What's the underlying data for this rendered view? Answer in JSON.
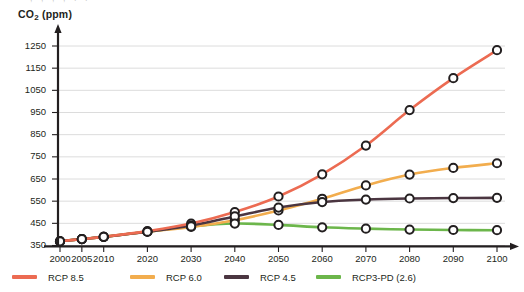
{
  "axis": {
    "y_title_main": "CO",
    "y_title_sub": "2",
    "y_title_unit": " (ppm)",
    "y_title_full": "CO2 (ppm)"
  },
  "legend": {
    "items": [
      {
        "label": "RCP 8.5",
        "color": "#ec6b52"
      },
      {
        "label": "RCP 6.0",
        "color": "#f2ad4e"
      },
      {
        "label": "RCP 4.5",
        "color": "#4b3641"
      },
      {
        "label": "RCP3-PD (2.6)",
        "color": "#6cb64b"
      }
    ]
  },
  "chart_data": {
    "type": "line",
    "title": "",
    "xlabel": "",
    "ylabel": "CO2 (ppm)",
    "x": [
      2000,
      2005,
      2010,
      2020,
      2030,
      2040,
      2050,
      2060,
      2070,
      2080,
      2090,
      2100
    ],
    "xtick_labels": [
      "2000",
      "2005",
      "2010",
      "2020",
      "2030",
      "2040",
      "2050",
      "2060",
      "2070",
      "2080",
      "2090",
      "2100"
    ],
    "ytick_labels": [
      "350",
      "450",
      "550",
      "650",
      "750",
      "850",
      "950",
      "1050",
      "1150",
      "1250"
    ],
    "yticks": [
      350,
      450,
      550,
      650,
      750,
      850,
      950,
      1050,
      1150,
      1250
    ],
    "ylim": [
      350,
      1290
    ],
    "grid": "horizontal",
    "legend_position": "below",
    "series": [
      {
        "name": "RCP 8.5",
        "color": "#ec6b52",
        "values": [
          369,
          379,
          389,
          415,
          449,
          501,
          571,
          671,
          801,
          961,
          1105,
          1231
        ]
      },
      {
        "name": "RCP 6.0",
        "color": "#f2ad4e",
        "values": [
          369,
          379,
          389,
          412,
          434,
          464,
          508,
          561,
          621,
          670,
          700,
          721
        ]
      },
      {
        "name": "RCP 4.5",
        "color": "#4b3641",
        "values": [
          369,
          379,
          389,
          412,
          440,
          481,
          521,
          546,
          557,
          562,
          564,
          565
        ]
      },
      {
        "name": "RCP3-PD (2.6)",
        "color": "#6cb64b",
        "values": [
          369,
          379,
          389,
          412,
          436,
          449,
          443,
          432,
          426,
          422,
          420,
          419
        ]
      }
    ]
  }
}
